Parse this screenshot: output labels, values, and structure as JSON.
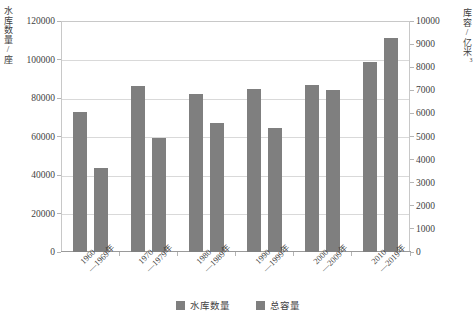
{
  "chart_data": {
    "type": "bar",
    "title": "",
    "categories": [
      "1960—1969年",
      "1970—1979年",
      "1980—1989年",
      "1990—1999年",
      "2000—2009年",
      "2010—2019年"
    ],
    "category_lines": [
      [
        "1960",
        "—1969年"
      ],
      [
        "1970",
        "—1979年"
      ],
      [
        "1980",
        "—1989年"
      ],
      [
        "1990",
        "—1999年"
      ],
      [
        "2000",
        "—2009年"
      ],
      [
        "2010",
        "—2019年"
      ]
    ],
    "series": [
      {
        "name": "水库数量",
        "axis": "left",
        "color": "#7f7f7f",
        "values": [
          72500,
          86500,
          82300,
          84500,
          86800,
          98500
        ]
      },
      {
        "name": "总容量",
        "axis": "right",
        "color": "#7f7f7f",
        "values": [
          3650,
          4950,
          5600,
          5350,
          7000,
          9250
        ]
      }
    ],
    "xlabel": "",
    "ylabel_left": "水库数量/座",
    "ylabel_right_text": "库容/亿米",
    "ylabel_right_sup": "3",
    "ylim_left": [
      0,
      120000
    ],
    "ylim_right": [
      0,
      10000
    ],
    "yticks_left": [
      0,
      20000,
      40000,
      60000,
      80000,
      100000,
      120000
    ],
    "yticks_right": [
      0,
      1000,
      2000,
      3000,
      4000,
      5000,
      6000,
      7000,
      8000,
      9000,
      10000
    ],
    "grid": true,
    "legend_position": "bottom",
    "legend": [
      "水库数量",
      "总容量"
    ]
  }
}
